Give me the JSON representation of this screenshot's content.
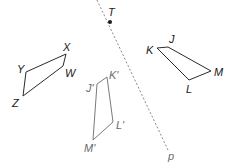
{
  "diagram": {
    "type": "geometry-reflection",
    "line": {
      "label": "p",
      "from": [
        97,
        0
      ],
      "to": [
        168,
        150
      ],
      "style": "dashed",
      "color": "#8a8a8a"
    },
    "point": {
      "label": "T",
      "x": 110,
      "y": 22,
      "color": "#1a1a1a"
    },
    "shapes": [
      {
        "name": "WXYZ",
        "color": "#2a2a2a",
        "vertices": [
          {
            "label": "Y",
            "x": 26,
            "y": 72
          },
          {
            "label": "X",
            "x": 66,
            "y": 54
          },
          {
            "label": "W",
            "x": 63,
            "y": 66
          },
          {
            "label": "Z",
            "x": 23,
            "y": 96
          }
        ]
      },
      {
        "name": "JKLM",
        "color": "#2a2a2a",
        "vertices": [
          {
            "label": "K",
            "x": 157,
            "y": 48
          },
          {
            "label": "J",
            "x": 168,
            "y": 47
          },
          {
            "label": "M",
            "x": 211,
            "y": 71
          },
          {
            "label": "L",
            "x": 189,
            "y": 80
          }
        ]
      },
      {
        "name": "J'K'L'M'",
        "color": "#7a7a7a",
        "vertices": [
          {
            "label": "J'",
            "x": 97,
            "y": 84
          },
          {
            "label": "K'",
            "x": 107,
            "y": 77
          },
          {
            "label": "L'",
            "x": 113,
            "y": 122
          },
          {
            "label": "M'",
            "x": 93,
            "y": 140
          }
        ]
      }
    ],
    "labels": {
      "T": "T",
      "p": "p",
      "X": "X",
      "Y": "Y",
      "W": "W",
      "Z": "Z",
      "J": "J",
      "K": "K",
      "L": "L",
      "M": "M",
      "J_prime": "J'",
      "K_prime": "K'",
      "L_prime": "L'",
      "M_prime": "M'"
    }
  }
}
